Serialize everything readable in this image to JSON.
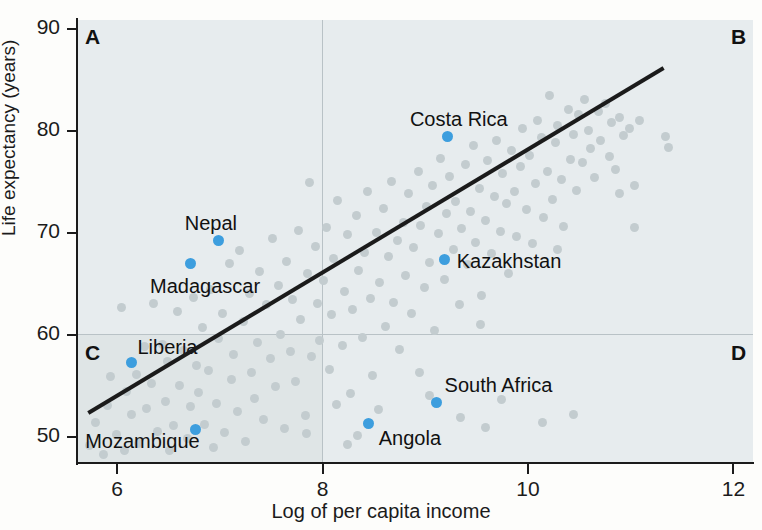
{
  "chart_data": {
    "type": "scatter",
    "title": "",
    "xlabel": "Log of per capita income",
    "ylabel": "Life expectancy (years)",
    "xlim": [
      5.62,
      12.2
    ],
    "ylim": [
      47.4,
      90.8
    ],
    "xticks": [
      6,
      8,
      10,
      12
    ],
    "xtick_labels": [
      "6",
      "8",
      "10",
      "12"
    ],
    "yticks": [
      50,
      60,
      70,
      80,
      90
    ],
    "ytick_labels": [
      "50",
      "60",
      "70",
      "80",
      "90"
    ],
    "grid": false,
    "quadrant_divider_x": 8,
    "quadrant_divider_y": 60,
    "quadrants": [
      {
        "id": "A",
        "label": "A",
        "position": "top-left",
        "shaded": true
      },
      {
        "id": "B",
        "label": "B",
        "position": "top-right",
        "shaded": true
      },
      {
        "id": "C",
        "label": "C",
        "position": "bottom-left",
        "shaded": true
      },
      {
        "id": "D",
        "label": "D",
        "position": "bottom-right",
        "shaded": true
      }
    ],
    "trendline": {
      "x0": 5.73,
      "y0": 52.3,
      "x1": 11.33,
      "y1": 86.1,
      "color": "#1b1b1b"
    },
    "colors": {
      "point": "#c3cccf",
      "highlight": "#3d9ede",
      "axis": "#1b1b1b",
      "panel": "#e7ecee",
      "panel_shaded": "#dfe5e6"
    },
    "highlighted": [
      {
        "name": "Nepal",
        "x": 7.0,
        "y": 69.2,
        "label_dx": -34,
        "label_dy": -27
      },
      {
        "name": "Madagascar",
        "x": 6.72,
        "y": 66.9,
        "label_dx": -40,
        "label_dy": 12
      },
      {
        "name": "Liberia",
        "x": 6.15,
        "y": 57.2,
        "label_dx": 6,
        "label_dy": -26
      },
      {
        "name": "Mozambique",
        "x": 6.77,
        "y": 50.7,
        "label_dx": -110,
        "label_dy": 2
      },
      {
        "name": "Costa Rica",
        "x": 9.23,
        "y": 79.4,
        "label_dx": -38,
        "label_dy": -27
      },
      {
        "name": "Kazakhstan",
        "x": 9.2,
        "y": 67.3,
        "label_dx": 12,
        "label_dy": -9
      },
      {
        "name": "Angola",
        "x": 8.46,
        "y": 51.3,
        "label_dx": 10,
        "label_dy": 5
      },
      {
        "name": "South Africa",
        "x": 9.12,
        "y": 53.3,
        "label_dx": 8,
        "label_dy": -28
      }
    ],
    "points": [
      [
        5.74,
        49.1
      ],
      [
        5.8,
        51.4
      ],
      [
        5.88,
        48.2
      ],
      [
        5.92,
        53.0
      ],
      [
        5.95,
        55.9
      ],
      [
        6.0,
        50.2
      ],
      [
        6.05,
        62.6
      ],
      [
        6.08,
        48.6
      ],
      [
        6.1,
        54.4
      ],
      [
        6.15,
        52.2
      ],
      [
        6.2,
        56.1
      ],
      [
        6.22,
        49.3
      ],
      [
        6.28,
        58.8
      ],
      [
        6.3,
        52.7
      ],
      [
        6.35,
        55.2
      ],
      [
        6.36,
        63.0
      ],
      [
        6.4,
        50.5
      ],
      [
        6.45,
        59.0
      ],
      [
        6.48,
        53.4
      ],
      [
        6.5,
        57.3
      ],
      [
        6.52,
        48.6
      ],
      [
        6.56,
        51.1
      ],
      [
        6.6,
        62.2
      ],
      [
        6.62,
        55.0
      ],
      [
        6.66,
        58.4
      ],
      [
        6.7,
        49.8
      ],
      [
        6.72,
        52.9
      ],
      [
        6.75,
        63.6
      ],
      [
        6.78,
        57.0
      ],
      [
        6.8,
        54.3
      ],
      [
        6.84,
        60.7
      ],
      [
        6.86,
        51.2
      ],
      [
        6.9,
        56.5
      ],
      [
        6.92,
        64.4
      ],
      [
        6.95,
        48.9
      ],
      [
        6.98,
        53.2
      ],
      [
        7.0,
        59.6
      ],
      [
        7.04,
        62.0
      ],
      [
        7.06,
        50.4
      ],
      [
        7.1,
        66.9
      ],
      [
        7.12,
        55.6
      ],
      [
        7.14,
        58.0
      ],
      [
        7.18,
        52.4
      ],
      [
        7.2,
        68.2
      ],
      [
        7.24,
        61.3
      ],
      [
        7.26,
        49.5
      ],
      [
        7.3,
        64.0
      ],
      [
        7.32,
        56.3
      ],
      [
        7.35,
        53.7
      ],
      [
        7.38,
        59.2
      ],
      [
        7.4,
        66.2
      ],
      [
        7.44,
        51.7
      ],
      [
        7.46,
        62.9
      ],
      [
        7.5,
        57.6
      ],
      [
        7.52,
        69.4
      ],
      [
        7.55,
        54.9
      ],
      [
        7.58,
        64.8
      ],
      [
        7.6,
        60.0
      ],
      [
        7.64,
        50.8
      ],
      [
        7.66,
        67.1
      ],
      [
        7.7,
        58.3
      ],
      [
        7.72,
        63.4
      ],
      [
        7.75,
        55.4
      ],
      [
        7.78,
        70.2
      ],
      [
        7.8,
        61.5
      ],
      [
        7.84,
        52.1
      ],
      [
        7.86,
        66.0
      ],
      [
        7.88,
        74.9
      ],
      [
        7.9,
        57.8
      ],
      [
        7.94,
        68.6
      ],
      [
        7.96,
        63.0
      ],
      [
        7.98,
        59.4
      ],
      [
        8.02,
        65.3
      ],
      [
        8.05,
        70.5
      ],
      [
        8.08,
        56.6
      ],
      [
        8.1,
        61.9
      ],
      [
        8.12,
        67.4
      ],
      [
        8.16,
        73.1
      ],
      [
        8.2,
        58.9
      ],
      [
        8.22,
        64.2
      ],
      [
        8.25,
        69.8
      ],
      [
        8.28,
        54.2
      ],
      [
        8.3,
        62.4
      ],
      [
        8.34,
        71.6
      ],
      [
        8.36,
        66.3
      ],
      [
        8.4,
        59.7
      ],
      [
        8.42,
        68.0
      ],
      [
        8.45,
        74.0
      ],
      [
        8.48,
        63.5
      ],
      [
        8.5,
        56.0
      ],
      [
        8.54,
        70.0
      ],
      [
        8.56,
        65.1
      ],
      [
        8.6,
        72.3
      ],
      [
        8.62,
        60.8
      ],
      [
        8.65,
        67.6
      ],
      [
        8.68,
        75.0
      ],
      [
        8.7,
        63.1
      ],
      [
        8.74,
        69.2
      ],
      [
        8.76,
        58.5
      ],
      [
        8.8,
        71.0
      ],
      [
        8.82,
        65.8
      ],
      [
        8.85,
        73.8
      ],
      [
        8.88,
        62.0
      ],
      [
        8.9,
        68.5
      ],
      [
        8.94,
        76.0
      ],
      [
        8.96,
        70.7
      ],
      [
        9.0,
        64.6
      ],
      [
        9.02,
        72.5
      ],
      [
        9.05,
        67.0
      ],
      [
        9.08,
        74.6
      ],
      [
        9.1,
        60.4
      ],
      [
        9.14,
        69.9
      ],
      [
        9.16,
        77.2
      ],
      [
        9.2,
        65.4
      ],
      [
        9.22,
        71.8
      ],
      [
        9.25,
        75.5
      ],
      [
        9.28,
        68.3
      ],
      [
        9.3,
        73.0
      ],
      [
        9.34,
        62.9
      ],
      [
        9.36,
        70.4
      ],
      [
        9.4,
        76.6
      ],
      [
        9.42,
        66.8
      ],
      [
        9.45,
        72.0
      ],
      [
        9.48,
        78.5
      ],
      [
        9.5,
        69.0
      ],
      [
        9.54,
        74.3
      ],
      [
        9.56,
        63.8
      ],
      [
        9.6,
        71.2
      ],
      [
        9.62,
        77.0
      ],
      [
        9.65,
        67.9
      ],
      [
        9.68,
        73.5
      ],
      [
        9.7,
        79.0
      ],
      [
        9.74,
        70.1
      ],
      [
        9.76,
        75.8
      ],
      [
        9.8,
        72.8
      ],
      [
        9.82,
        66.0
      ],
      [
        9.85,
        78.0
      ],
      [
        9.88,
        74.0
      ],
      [
        9.9,
        69.6
      ],
      [
        9.94,
        76.4
      ],
      [
        9.96,
        80.2
      ],
      [
        10.0,
        72.2
      ],
      [
        10.02,
        77.5
      ],
      [
        10.05,
        68.9
      ],
      [
        10.08,
        74.8
      ],
      [
        10.1,
        81.0
      ],
      [
        10.14,
        79.3
      ],
      [
        10.16,
        71.5
      ],
      [
        10.2,
        76.0
      ],
      [
        10.22,
        83.4
      ],
      [
        10.25,
        73.2
      ],
      [
        10.28,
        78.8
      ],
      [
        10.3,
        80.5
      ],
      [
        10.34,
        75.2
      ],
      [
        10.36,
        70.6
      ],
      [
        10.4,
        82.0
      ],
      [
        10.42,
        77.1
      ],
      [
        10.45,
        79.6
      ],
      [
        10.48,
        74.1
      ],
      [
        10.5,
        81.5
      ],
      [
        10.54,
        76.8
      ],
      [
        10.56,
        83.0
      ],
      [
        10.6,
        80.0
      ],
      [
        10.62,
        78.2
      ],
      [
        10.66,
        75.4
      ],
      [
        10.7,
        81.8
      ],
      [
        10.72,
        79.0
      ],
      [
        10.76,
        82.6
      ],
      [
        10.8,
        77.4
      ],
      [
        10.82,
        80.8
      ],
      [
        10.86,
        76.2
      ],
      [
        10.9,
        81.2
      ],
      [
        10.94,
        79.5
      ],
      [
        11.0,
        80.2
      ],
      [
        11.05,
        74.6
      ],
      [
        11.1,
        81.0
      ],
      [
        11.35,
        79.4
      ],
      [
        11.38,
        78.3
      ],
      [
        9.35,
        51.9
      ],
      [
        9.6,
        50.9
      ],
      [
        10.15,
        51.4
      ],
      [
        8.15,
        53.1
      ],
      [
        8.55,
        52.6
      ],
      [
        9.05,
        54.0
      ],
      [
        7.85,
        50.3
      ],
      [
        8.95,
        56.3
      ],
      [
        9.75,
        53.6
      ],
      [
        10.45,
        52.2
      ],
      [
        8.35,
        50.1
      ],
      [
        10.9,
        73.8
      ],
      [
        11.05,
        70.5
      ],
      [
        10.3,
        68.3
      ],
      [
        9.55,
        61.0
      ],
      [
        8.25,
        49.2
      ]
    ]
  }
}
